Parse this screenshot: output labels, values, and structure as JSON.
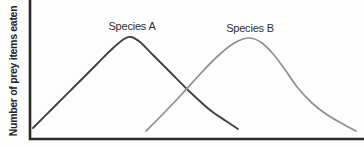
{
  "figure": {
    "background": "#fdfdfd"
  },
  "colors": {
    "axis": "#2a2a2a",
    "label_text": "#2e2e2e"
  },
  "chart_data": {
    "type": "line",
    "title": "",
    "xlabel": "",
    "ylabel": "Number of prey items eaten",
    "x_ticks": [],
    "y_ticks": [],
    "grid": false,
    "legend_position": "inline-labels-above-peaks",
    "axes": {
      "x_axis_px": [
        30,
        363
      ],
      "y_axis_px": [
        0,
        139
      ],
      "origin_px": [
        30,
        139
      ]
    },
    "series": [
      {
        "name": "Species A",
        "color": "#414141",
        "peak_x_px": 131,
        "label_center_x_px": 132,
        "points_px": [
          [
            33,
            128
          ],
          [
            52,
            109
          ],
          [
            74,
            87
          ],
          [
            96,
            65
          ],
          [
            112,
            49
          ],
          [
            124,
            39
          ],
          [
            131,
            37
          ],
          [
            140,
            42
          ],
          [
            153,
            55
          ],
          [
            170,
            72
          ],
          [
            190,
            92
          ],
          [
            210,
            110
          ],
          [
            226,
            121
          ],
          [
            238,
            129
          ]
        ]
      },
      {
        "name": "Species B",
        "color": "#8f8f8f",
        "peak_x_px": 250,
        "label_center_x_px": 250,
        "points_px": [
          [
            146,
            131
          ],
          [
            163,
            114
          ],
          [
            182,
            94
          ],
          [
            202,
            72
          ],
          [
            220,
            54
          ],
          [
            236,
            42
          ],
          [
            250,
            38
          ],
          [
            262,
            43
          ],
          [
            274,
            55
          ],
          [
            286,
            71
          ],
          [
            298,
            88
          ],
          [
            312,
            103
          ],
          [
            326,
            114
          ],
          [
            341,
            123
          ],
          [
            356,
            131
          ]
        ]
      }
    ]
  }
}
